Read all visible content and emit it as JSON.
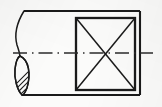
{
  "figure": {
    "drawing_type": "mechanical-engineering-orthographic-view",
    "canvas": {
      "width": 162,
      "height": 107
    },
    "background_color": "#fbfbfa",
    "line_color": "#1a1a1a",
    "centerline_color": "#2b2b2b",
    "hatch_color": "#1a1a1a"
  },
  "geometry": {
    "outer_body": {
      "name": "cylindrical-body-outline",
      "top_line": {
        "x1": 24,
        "y1": 11,
        "x2": 140,
        "y2": 11
      },
      "bottom_line": {
        "x1": 22,
        "y1": 95,
        "x2": 140,
        "y2": 95
      },
      "right_line": {
        "x1": 140,
        "y1": 11,
        "x2": 140,
        "y2": 95
      },
      "stroke_width": 2.1
    },
    "break_line": {
      "name": "freehand-break-line",
      "path": "M 24 11 C 16 24, 14 34, 17 45 C 19 51, 20 53, 20 57 C 20 70, 22 85, 22 95",
      "stroke_width": 1.5
    },
    "section_lens": {
      "name": "hatched-section-lens",
      "path": "M 20 56 C 29 60, 31 74, 27 88 C 25 93, 23 95, 22 95 C 17 90, 14 78, 15 69 C 16 61, 18 57, 20 56 Z",
      "stroke_width": 1.4,
      "hatch_angle_deg": 45,
      "hatch_line_count": 7,
      "hatch_spacing_px": 5
    },
    "square_feature": {
      "name": "square-section-face",
      "x": 76,
      "y": 18,
      "width": 59,
      "height": 72,
      "stroke_width": 2.3,
      "diagonals": [
        {
          "x1": 76,
          "y1": 18,
          "x2": 135,
          "y2": 90
        },
        {
          "x1": 135,
          "y1": 18,
          "x2": 76,
          "y2": 90
        }
      ],
      "diagonal_stroke_width": 1.5,
      "meaning": "crossed-diagonals-indicate-flat-square-surface"
    },
    "centerline": {
      "name": "axis-centerline",
      "y": 53,
      "x_start": 13,
      "x_end": 153,
      "stroke_width": 1.6,
      "dash_pattern": "14 5 1.5 5"
    }
  },
  "labels": {
    "none_visible": ""
  }
}
